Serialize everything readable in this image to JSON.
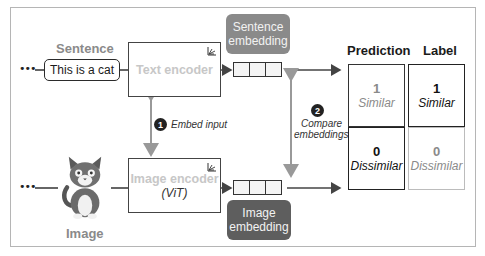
{
  "input_text": {
    "title": "Sentence",
    "value": "This is a cat"
  },
  "input_image": {
    "title": "Image",
    "icon": "cat-illustration"
  },
  "ellipsis": "•••",
  "text_encoder": {
    "label": "Text encoder",
    "icon": "model-icon"
  },
  "image_encoder": {
    "label": "Image encoder",
    "sublabel": "(ViT)",
    "icon": "model-icon"
  },
  "sentence_embedding": {
    "line1": "Sentence",
    "line2": "embedding"
  },
  "image_embedding": {
    "line1": "Image",
    "line2": "embedding"
  },
  "steps": [
    {
      "number": "1",
      "label": "Embed input"
    },
    {
      "number": "2",
      "label_line1": "Compare",
      "label_line2": "embeddings"
    }
  ],
  "table": {
    "headers": {
      "prediction": "Prediction",
      "label": "Label"
    },
    "rows": [
      {
        "prediction_value": "1",
        "prediction_text": "Similar",
        "label_value": "1",
        "label_text": "Similar"
      },
      {
        "prediction_value": "0",
        "prediction_text": "Dissimilar",
        "label_value": "0",
        "label_text": "Dissimilar"
      }
    ]
  },
  "colors": {
    "sentence_embedding_bg": "#8a8a8a",
    "image_embedding_bg": "#5e5e5e",
    "arrow": "#555555",
    "gray_arrow": "#999999"
  }
}
